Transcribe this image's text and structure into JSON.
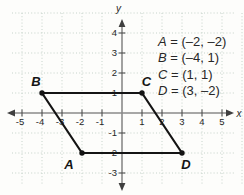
{
  "chart_data": {
    "type": "scatter",
    "points": [
      {
        "label": "A",
        "x": -2,
        "y": -2
      },
      {
        "label": "B",
        "x": -4,
        "y": 1
      },
      {
        "label": "C",
        "x": 1,
        "y": 1
      },
      {
        "label": "D",
        "x": 3,
        "y": -2
      }
    ],
    "polygon": [
      "B",
      "C",
      "D",
      "A"
    ],
    "x_ticks": [
      {
        "v": -5,
        "label": "-5"
      },
      {
        "v": -4,
        "label": "-4"
      },
      {
        "v": -3,
        "label": "-3"
      },
      {
        "v": -2,
        "label": "-2"
      },
      {
        "v": -1,
        "label": "-1"
      },
      {
        "v": 1,
        "label": "1"
      },
      {
        "v": 2,
        "label": "2"
      },
      {
        "v": 3,
        "label": "3"
      },
      {
        "v": 4,
        "label": "4"
      },
      {
        "v": 5,
        "label": "5"
      }
    ],
    "y_ticks": [
      {
        "v": 4,
        "label": "4"
      },
      {
        "v": 3,
        "label": "3"
      },
      {
        "v": 2,
        "label": "2"
      },
      {
        "v": 1,
        "label": "1"
      },
      {
        "v": -1,
        "label": "-1"
      },
      {
        "v": -2,
        "label": "-2"
      },
      {
        "v": -3,
        "label": "-3"
      }
    ],
    "extra_gridlines_y": [
      5
    ],
    "extra_gridlines_x": [
      6
    ],
    "xlabel": "x",
    "ylabel": "y",
    "xlim": [
      -5.7,
      6.1
    ],
    "ylim": [
      -4.1,
      5.0
    ],
    "grid": true,
    "legend": {
      "position": "top-right",
      "separator": " = ",
      "entries": [
        {
          "name": "A",
          "coords": "(–2, –2)"
        },
        {
          "name": "B",
          "coords": "(–4, 1)"
        },
        {
          "name": "C",
          "coords": "(1, 1)"
        },
        {
          "name": "D",
          "coords": "(3, –2)"
        }
      ]
    }
  },
  "colors": {
    "background": "#fdfdfb",
    "grid": "#c0cec5",
    "axis": "#8a8a8a",
    "tick": "#4f4f4f",
    "arrow": "#3f3f3f",
    "shape": "#141414",
    "text": "#272727"
  }
}
